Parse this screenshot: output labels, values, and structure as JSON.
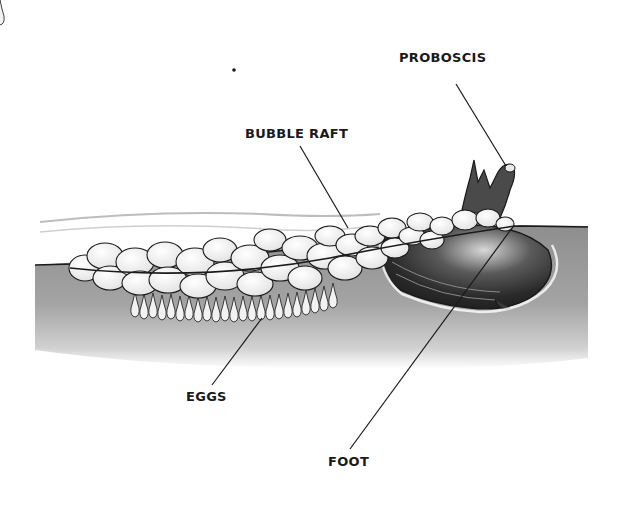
{
  "figure": {
    "labels": {
      "proboscis": "PROBOSCIS",
      "bubble_raft": "BUBBLE RAFT",
      "eggs": "EGGS",
      "foot": "FOOT"
    },
    "colors": {
      "water": "#9a9a9a",
      "water_dark": "#7d7d7d",
      "outline": "#1a1a1a",
      "bubble_fill": "#f4f4f4",
      "shell_dark": "#2a2a2a",
      "shell_mid": "#6a6a6a",
      "background": "#ffffff"
    }
  }
}
